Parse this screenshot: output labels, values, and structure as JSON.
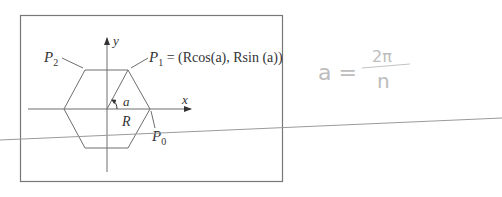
{
  "diagram": {
    "axes": {
      "x_label": "x",
      "y_label": "y"
    },
    "angle_label": "a",
    "radius_label": "R",
    "points": {
      "p0": {
        "name": "P",
        "sub": "0"
      },
      "p1": {
        "name": "P",
        "sub": "1",
        "formula": " = (Rcos(a), Rsin (a))"
      },
      "p2": {
        "name": "P",
        "sub": "2"
      }
    },
    "shape": "regular hexagon"
  },
  "handwritten_note": {
    "lhs": "a =",
    "numerator": "2π",
    "denominator": "n"
  },
  "colors": {
    "line": "#6e6e6e",
    "text": "#333333",
    "pencil": "#bdbdbd"
  }
}
